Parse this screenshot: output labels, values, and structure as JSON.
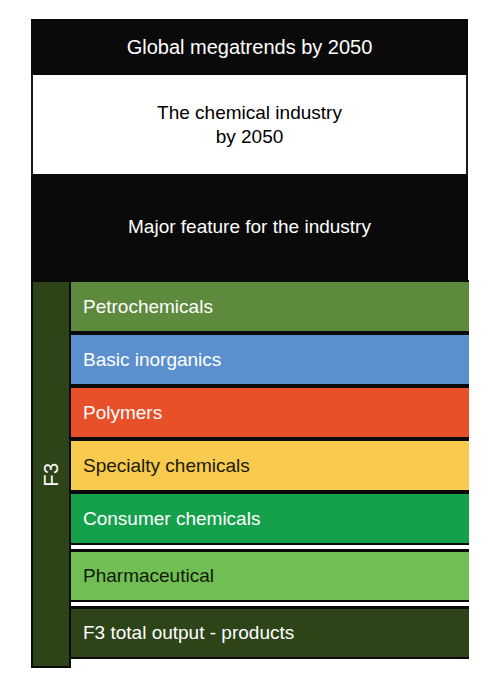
{
  "diagram": {
    "title": "Global megatrends by 2050",
    "header_boxes": [
      {
        "id": "megatrends",
        "label": "Global megatrends by 2050",
        "style": "dark"
      },
      {
        "id": "chemical-industry",
        "label": "The chemical industry\nby 2050",
        "style": "light"
      },
      {
        "id": "major-feature",
        "label": "Major feature for the industry",
        "style": "dark"
      }
    ],
    "spine": {
      "label": "F3",
      "color": "#2d4418",
      "orientation": "vertical"
    },
    "bars": [
      {
        "id": "petrochemicals",
        "label": "Petrochemicals",
        "color": "#5d8a3d",
        "text_color": "#ffffff",
        "gap_above": false
      },
      {
        "id": "basic-inorganics",
        "label": "Basic inorganics",
        "color": "#5b8fce",
        "text_color": "#ffffff",
        "gap_above": false
      },
      {
        "id": "polymers",
        "label": "Polymers",
        "color": "#e8502a",
        "text_color": "#ffffff",
        "gap_above": false
      },
      {
        "id": "specialty-chemicals",
        "label": "Specialty chemicals",
        "color": "#f8ca4d",
        "text_color": "#1a1a05",
        "gap_above": false
      },
      {
        "id": "consumer-chemicals",
        "label": "Consumer chemicals",
        "color": "#15a04c",
        "text_color": "#ffffff",
        "gap_above": false
      },
      {
        "id": "pharmaceutical",
        "label": "Pharmaceutical",
        "color": "#71bf54",
        "text_color": "#101a08",
        "gap_above": true
      },
      {
        "id": "f3-total-output",
        "label": "F3 total output - products",
        "color": "#2d4418",
        "text_color": "#ffffff",
        "gap_above": true
      }
    ]
  }
}
